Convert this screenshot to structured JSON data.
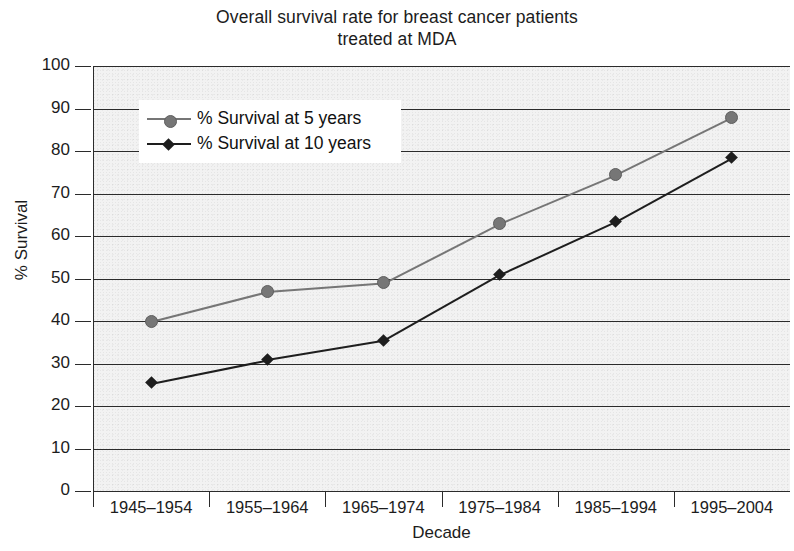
{
  "chart_data": {
    "type": "line",
    "title": "Overall survival rate for breast cancer patients treated at MDA",
    "title_line1": "Overall survival rate for breast cancer patients",
    "title_line2": "treated at MDA",
    "xlabel": "Decade",
    "ylabel": "% Survival",
    "categories": [
      "1945–1954",
      "1955–1964",
      "1965–1974",
      "1975–1984",
      "1985–1994",
      "1995–2004"
    ],
    "ylim": [
      0,
      100
    ],
    "ytick_labels": [
      "100",
      "90",
      "80",
      "70",
      "60",
      "50",
      "40",
      "30",
      "20",
      "10",
      "0"
    ],
    "ytick_values": [
      100,
      90,
      80,
      70,
      60,
      50,
      40,
      30,
      20,
      10,
      0
    ],
    "grid": true,
    "grid_axis": "y",
    "legend_position": "upper left",
    "series": [
      {
        "name": "% Survival at 5 years",
        "marker": "circle",
        "color": "#767676",
        "values": [
          40,
          47,
          49,
          63,
          74.5,
          88
        ]
      },
      {
        "name": "% Survival at 10 years",
        "marker": "diamond",
        "color": "#1e1e1e",
        "values": [
          25.5,
          31,
          35.5,
          51,
          63.5,
          78.5
        ]
      }
    ]
  },
  "legend": {
    "items": [
      {
        "label": "% Survival at 5 years"
      },
      {
        "label": "% Survival at 10 years"
      }
    ]
  }
}
